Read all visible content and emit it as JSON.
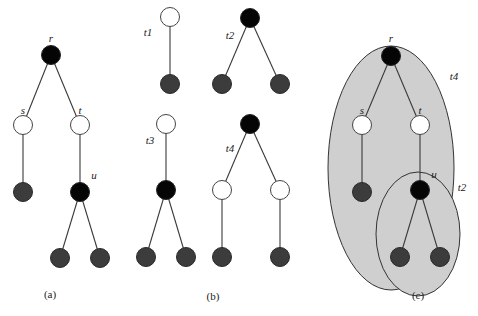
{
  "figure": {
    "panels": [
      {
        "id": "a",
        "caption": "(a)",
        "node_labels": {
          "r": "r",
          "s": "s",
          "t": "t",
          "u": "u"
        },
        "nodes": [
          {
            "id": "r",
            "color": "black"
          },
          {
            "id": "s",
            "color": "white"
          },
          {
            "id": "t",
            "color": "white"
          },
          {
            "id": "s_leaf",
            "color": "gray"
          },
          {
            "id": "u",
            "color": "black"
          },
          {
            "id": "u_leaf1",
            "color": "gray"
          },
          {
            "id": "u_leaf2",
            "color": "gray"
          }
        ],
        "edges": [
          [
            "r",
            "s"
          ],
          [
            "r",
            "t"
          ],
          [
            "s",
            "s_leaf"
          ],
          [
            "t",
            "u"
          ],
          [
            "u",
            "u_leaf1"
          ],
          [
            "u",
            "u_leaf2"
          ]
        ]
      },
      {
        "id": "b",
        "caption": "(b)",
        "patterns": [
          {
            "label": "t1",
            "nodes": [
              "white root",
              "gray leaf"
            ]
          },
          {
            "label": "t2",
            "nodes": [
              "black root",
              "gray leaf",
              "gray leaf"
            ]
          },
          {
            "label": "t3",
            "nodes": [
              "white root",
              "black child",
              "gray leaf",
              "gray leaf"
            ]
          },
          {
            "label": "t4",
            "nodes": [
              "black root",
              "white child",
              "white child",
              "gray leaf",
              "gray leaf"
            ]
          }
        ]
      },
      {
        "id": "c",
        "caption": "(c)",
        "node_labels": {
          "r": "r",
          "s": "s",
          "t": "t",
          "u": "u"
        },
        "cover_labels": {
          "big": "t4",
          "small": "t2"
        }
      }
    ],
    "colors": {
      "black_node": "#050505",
      "white_node": "#ffffff",
      "leaf_node": "#3c3c3c",
      "cover_fill": "#cfcfcf"
    }
  }
}
